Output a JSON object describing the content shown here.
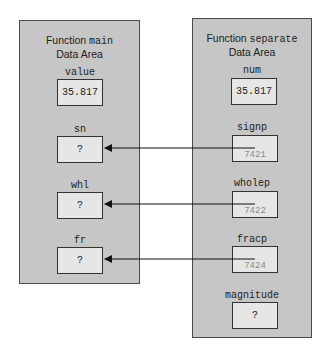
{
  "main_panel": {
    "title_prefix": "Function ",
    "title_func": "main",
    "title_line2": "Data Area",
    "variables": [
      {
        "name": "value",
        "value": "35.817"
      },
      {
        "name": "sn",
        "value": "?"
      },
      {
        "name": "whl",
        "value": "?"
      },
      {
        "name": "fr",
        "value": "?"
      }
    ]
  },
  "separate_panel": {
    "title_prefix": "Function ",
    "title_func": "separate",
    "title_line2": "Data Area",
    "variables": [
      {
        "name": "num",
        "value": "35.817",
        "address": ""
      },
      {
        "name": "signp",
        "value": "",
        "address": "7421"
      },
      {
        "name": "wholep",
        "value": "",
        "address": "7422"
      },
      {
        "name": "fracp",
        "value": "",
        "address": "7424"
      },
      {
        "name": "magnitude",
        "value": "?",
        "address": ""
      }
    ]
  },
  "arrows": [
    {
      "from": "signp",
      "to": "sn"
    },
    {
      "from": "wholep",
      "to": "whl"
    },
    {
      "from": "fracp",
      "to": "fr"
    }
  ],
  "colors": {
    "panel_fill": "#c6c6c6",
    "box_fill": "#e6e6e6",
    "border": "#333333",
    "address_text": "#8a8a8a"
  }
}
